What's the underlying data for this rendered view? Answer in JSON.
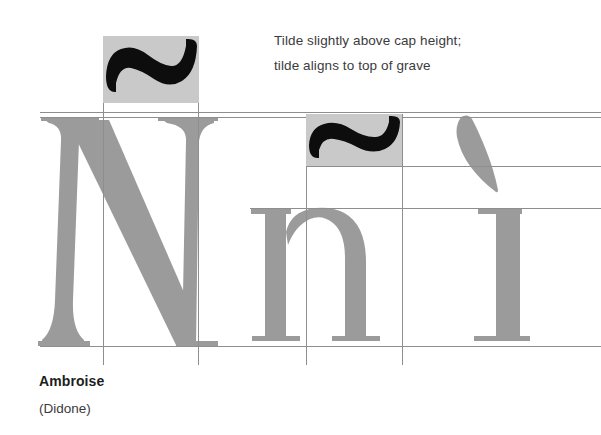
{
  "figure": {
    "kind": "typography-specimen-diagram",
    "background": "#ffffff",
    "width": 601,
    "height": 435
  },
  "annotation": {
    "line1": "Tilde slightly above cap height;",
    "line2": "tilde aligns to top of grave",
    "color": "#3b3b3b"
  },
  "caption": {
    "typeface_name": "Ambroise",
    "classification": "(Didone)"
  },
  "colors": {
    "glyph_gray": "#9b9b9b",
    "box_gray": "#c9c9c9",
    "accent_black": "#0d0d0d",
    "guide_line": "#8e8e8e",
    "text": "#1d1d1d"
  },
  "glyphs": [
    {
      "name": "capital-n",
      "character": "N",
      "case": "uppercase"
    },
    {
      "name": "lowercase-n",
      "character": "n",
      "case": "lowercase"
    },
    {
      "name": "lowercase-i",
      "character": "i",
      "case": "lowercase"
    }
  ],
  "accents": [
    {
      "name": "tilde-uppercase",
      "character": "~",
      "boxed": true
    },
    {
      "name": "tilde-lowercase",
      "character": "~",
      "boxed": true
    },
    {
      "name": "grave",
      "character": "`",
      "boxed": false
    }
  ],
  "guides": {
    "horizontal": [
      {
        "name": "tilde-top-line",
        "y": 112
      },
      {
        "name": "cap-height-line",
        "y": 117
      },
      {
        "name": "grave-top-alignment-line",
        "y": 166
      },
      {
        "name": "x-height-line",
        "y": 208
      },
      {
        "name": "baseline",
        "y": 346
      }
    ],
    "vertical": [
      {
        "name": "guide-1",
        "x": 103
      },
      {
        "name": "guide-2",
        "x": 198
      },
      {
        "name": "guide-3",
        "x": 306
      },
      {
        "name": "guide-4",
        "x": 402
      }
    ]
  }
}
